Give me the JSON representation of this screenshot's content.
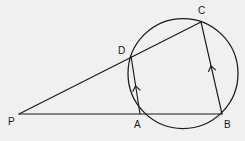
{
  "figure": {
    "background_color": "#f0f0f0",
    "stroke_color": "#1a1a1a",
    "canvas": {
      "width": 245,
      "height": 141
    },
    "circle": {
      "name": "circumcircle",
      "cx": 183,
      "cy": 73.5,
      "r": 55
    },
    "points": [
      {
        "id": "P",
        "label": "P",
        "x": 19,
        "y": 114,
        "label_x": 8,
        "label_y": 125,
        "on_circle": false
      },
      {
        "id": "A",
        "label": "A",
        "x": 140,
        "y": 114,
        "label_x": 134,
        "label_y": 128,
        "on_circle": true
      },
      {
        "id": "B",
        "label": "B",
        "x": 222,
        "y": 114,
        "label_x": 224,
        "label_y": 128,
        "on_circle": true
      },
      {
        "id": "C",
        "label": "C",
        "x": 201,
        "y": 22,
        "label_x": 198,
        "label_y": 14,
        "on_circle": true
      },
      {
        "id": "D",
        "label": "D",
        "x": 131,
        "y": 56,
        "label_x": 118,
        "label_y": 54,
        "on_circle": true
      }
    ],
    "segments": [
      {
        "id": "PC",
        "name": "secant-p-d-c",
        "from": "P",
        "to": "C",
        "through": "D"
      },
      {
        "id": "PB",
        "name": "secant-p-a-b",
        "from": "P",
        "to": "B",
        "through": "A"
      },
      {
        "id": "DA",
        "name": "chord-d-a",
        "from": "D",
        "to": "A",
        "arrow_marks": 1
      },
      {
        "id": "CB",
        "name": "chord-c-b",
        "from": "C",
        "to": "B",
        "arrow_marks": 1
      },
      {
        "id": "DC",
        "name": "chord-d-c",
        "from": "D",
        "to": "C",
        "arrow_marks": 0
      }
    ],
    "arrow_marks": [
      {
        "id": "mark-da",
        "on_segment": "DA",
        "x": 136,
        "y": 88
      },
      {
        "id": "mark-cb",
        "on_segment": "CB",
        "x": 211.5,
        "y": 68
      }
    ]
  }
}
